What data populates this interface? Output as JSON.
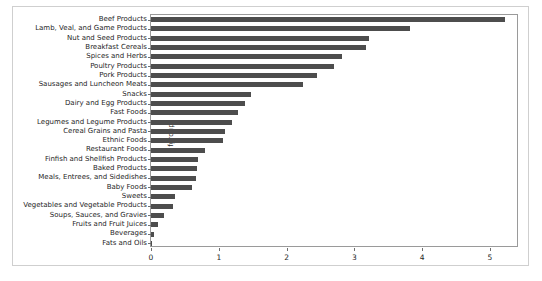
{
  "chart_data": {
    "type": "bar",
    "orientation": "horizontal",
    "title": "",
    "xlabel": "",
    "ylabel": "fgroup",
    "xlim": [
      0,
      5.43
    ],
    "xticks": [
      0,
      1,
      2,
      3,
      4,
      5
    ],
    "xtick_labels": [
      "0",
      "1",
      "2",
      "3",
      "4",
      "5"
    ],
    "grid": false,
    "legend": false,
    "bar_color": "#4d4d4d",
    "categories": [
      "Beef Products",
      "Lamb, Veal, and Game Products",
      "Nut and Seed Products",
      "Breakfast Cereals",
      "Spices and Herbs",
      "Poultry Products",
      "Pork Products",
      "Sausages and Luncheon Meats",
      "Snacks",
      "Dairy and Egg Products",
      "Fast Foods",
      "Legumes and Legume Products",
      "Cereal Grains and Pasta",
      "Ethnic Foods",
      "Restaurant Foods",
      "Finfish and Shellfish Products",
      "Baked Products",
      "Meals, Entrees, and Sidedishes",
      "Baby Foods",
      "Sweets",
      "Vegetables and Vegetable Products",
      "Soups, Sauces, and Gravies",
      "Fruits and Fruit Juices",
      "Beverages",
      "Fats and Oils"
    ],
    "values": [
      5.23,
      3.82,
      3.22,
      3.17,
      2.82,
      2.7,
      2.45,
      2.24,
      1.47,
      1.39,
      1.28,
      1.19,
      1.09,
      1.06,
      0.8,
      0.69,
      0.68,
      0.66,
      0.61,
      0.35,
      0.33,
      0.19,
      0.1,
      0.05,
      0.02
    ]
  }
}
